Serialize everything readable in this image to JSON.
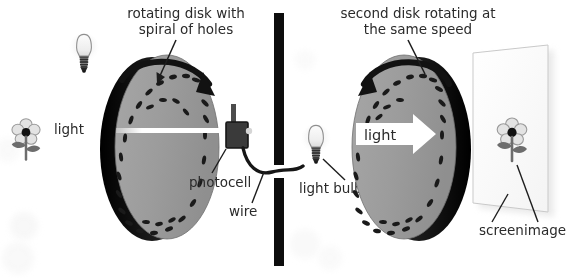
{
  "figure": {
    "title_absent": true,
    "background_color": "#ffffff",
    "ink_color": "#2b2b2b",
    "disk_face_color": "#9c9c9c",
    "disk_rim_color": "#131313",
    "hole_color": "#1a1a1a",
    "wall_color": "#0d0d0d",
    "screen_color": "#fdfdfd",
    "beam_color": "#ffffff"
  },
  "annotations": {
    "left_disk_caption_line1": "rotating disk with",
    "left_disk_caption_line2": "spiral of holes",
    "right_disk_caption_line1": "second disk rotating at",
    "right_disk_caption_line2": "the same speed",
    "source_light_label": "light",
    "photocell_label": "photocell",
    "wire_label": "wire",
    "light_bulb_label": "light bulb",
    "beam_label": "light",
    "screen_label": "screen",
    "image_label": "image"
  },
  "objects": {
    "source_bulb": "light-bulb-icon",
    "source_flower": "flower-icon",
    "left_disk": "rotating-disk",
    "left_disk_rotation": "clockwise-arrow",
    "photocell": "photocell-box",
    "wall": "opaque-wall",
    "wire": "connecting-wire",
    "output_bulb": "light-bulb-icon",
    "right_disk": "rotating-disk",
    "right_disk_rotation": "counterclockwise-arrow",
    "screen": "projection-screen",
    "screen_flower": "flower-icon"
  },
  "disk_geometry": {
    "left": {
      "cx": 163,
      "cy": 147,
      "rx": 53,
      "ry": 93,
      "holes": 24
    },
    "right": {
      "cx": 406,
      "cy": 147,
      "rx": 53,
      "ry": 93,
      "holes": 24
    }
  }
}
